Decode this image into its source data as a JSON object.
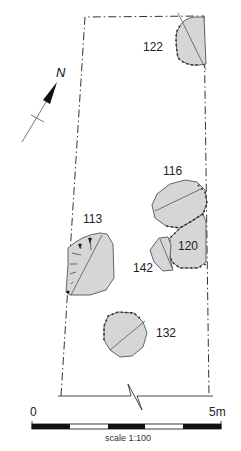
{
  "figure": {
    "type": "archaeological site plan",
    "north_label": "N",
    "features": [
      {
        "id": "122",
        "label": "122"
      },
      {
        "id": "116",
        "label": "116"
      },
      {
        "id": "113",
        "label": "113"
      },
      {
        "id": "120",
        "label": "120"
      },
      {
        "id": "142",
        "label": "142"
      },
      {
        "id": "132",
        "label": "132"
      }
    ],
    "scale_bar": {
      "start_label": "0",
      "end_label": "5m",
      "caption": "scale 1:100",
      "segments": 5
    },
    "colors": {
      "feature_fill": "#d6d6d6",
      "outline": "#555555",
      "boundary": "#333333",
      "scale_black": "#111111"
    }
  }
}
